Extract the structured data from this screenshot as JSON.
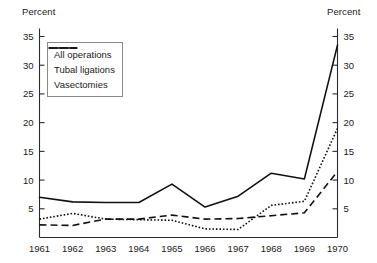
{
  "chart_data": {
    "type": "line",
    "title": "",
    "xlabel": "",
    "ylabel": "Percent",
    "ylabel_right": "Percent",
    "grid": false,
    "legend_position": "top-left",
    "xlim": [
      1961,
      1970
    ],
    "ylim": [
      0,
      35
    ],
    "ytick_values": [
      5,
      10,
      15,
      20,
      25,
      30,
      35
    ],
    "ytick_labels_left": [
      "5",
      "10",
      "15",
      "20",
      "25",
      "30",
      "35"
    ],
    "ytick_labels_right": [
      "5",
      "10",
      "15",
      "20",
      "25",
      "30",
      "35"
    ],
    "x": [
      1961,
      1962,
      1963,
      1964,
      1965,
      1966,
      1967,
      1968,
      1969,
      1970
    ],
    "xtick_labels": [
      "1961",
      "1962",
      "1963",
      "1964",
      "1965",
      "1966",
      "1967",
      "1968",
      "1969",
      "1970"
    ],
    "series": [
      {
        "name": "All operations",
        "style": "solid",
        "values": [
          7.0,
          6.2,
          6.1,
          6.1,
          9.3,
          5.3,
          7.2,
          11.2,
          10.2,
          33.5
        ]
      },
      {
        "name": "Tubal ligations",
        "style": "dashed",
        "values": [
          2.2,
          2.1,
          3.2,
          3.2,
          3.9,
          3.2,
          3.3,
          3.8,
          4.3,
          11.5
        ]
      },
      {
        "name": "Vasectomies",
        "style": "dotted",
        "values": [
          3.2,
          4.2,
          3.2,
          3.1,
          3.0,
          1.5,
          1.4,
          5.6,
          6.3,
          19.0
        ]
      }
    ]
  },
  "axis_titles": {
    "left": "Percent",
    "right": "Percent"
  },
  "legend": {
    "items": [
      {
        "label": "All operations",
        "style": "solid"
      },
      {
        "label": "Tubal ligations",
        "style": "dashed"
      },
      {
        "label": "Vasectomies",
        "style": "dotted"
      }
    ]
  },
  "colors": {
    "line": "#111111",
    "axis": "#2b2b2b",
    "text": "#1a1a1a",
    "legend_border": "#8a8a8a",
    "background": "#ffffff"
  }
}
